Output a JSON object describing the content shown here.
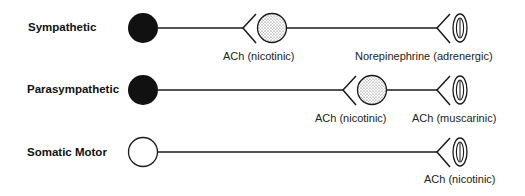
{
  "rows": [
    {
      "label": "Sympathetic",
      "soma": "filled",
      "synapses": [
        {
          "type": "ganglion",
          "caption": "ACh (nicotinic)"
        },
        {
          "type": "effector",
          "caption": "Norepinephrine (adrenergic)"
        }
      ]
    },
    {
      "label": "Parasympathetic",
      "soma": "filled",
      "synapses": [
        {
          "type": "ganglion",
          "caption": "ACh (nicotinic)"
        },
        {
          "type": "effector",
          "caption": "ACh (muscarinic)"
        }
      ]
    },
    {
      "label": "Somatic Motor",
      "soma": "open",
      "synapses": [
        {
          "type": "effector",
          "caption": "ACh (nicotinic)"
        }
      ]
    }
  ],
  "colors": {
    "line": "#1a1a1a",
    "soma_fill": "#111111",
    "ganglion_fill": "#d9d9d9",
    "background": "#ffffff"
  }
}
